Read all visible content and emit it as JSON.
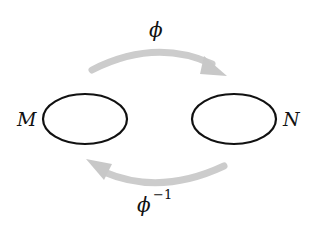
{
  "diagram": {
    "sets": [
      {
        "label": "M",
        "cx": 85,
        "cy": 119,
        "rx": 42,
        "ry": 25
      },
      {
        "label": "N",
        "cx": 234,
        "cy": 119,
        "rx": 42,
        "ry": 25
      }
    ],
    "maps": [
      {
        "label": "ϕ",
        "superscript": "",
        "from": "M",
        "to": "N",
        "position": "top"
      },
      {
        "label": "ϕ",
        "superscript": "−1",
        "from": "N",
        "to": "M",
        "position": "bottom"
      }
    ],
    "colors": {
      "outline": "#111111",
      "arrow": "#cccccc",
      "background": "#ffffff"
    }
  }
}
